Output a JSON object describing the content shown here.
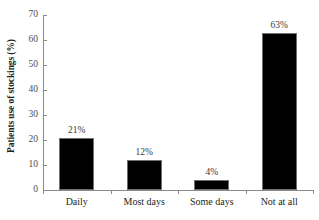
{
  "chart_data": {
    "type": "bar",
    "title": "",
    "xlabel": "",
    "ylabel": "Patients use of stockings (%)",
    "categories": [
      "Daily",
      "Most days",
      "Some days",
      "Not at all"
    ],
    "values": [
      21,
      12,
      4,
      63
    ],
    "value_labels": [
      "21%",
      "12%",
      "4%",
      "63%"
    ],
    "ylim": [
      0,
      70
    ],
    "ytick_labels": [
      "0",
      "10",
      "20",
      "30",
      "40",
      "50",
      "60",
      "70"
    ],
    "ytick_values": [
      0,
      10,
      20,
      30,
      40,
      50,
      60,
      70
    ],
    "grid": false,
    "legend": false,
    "bar_color": "#000000",
    "axis_color": "#8a8a8a",
    "background_color": "#ffffff"
  }
}
